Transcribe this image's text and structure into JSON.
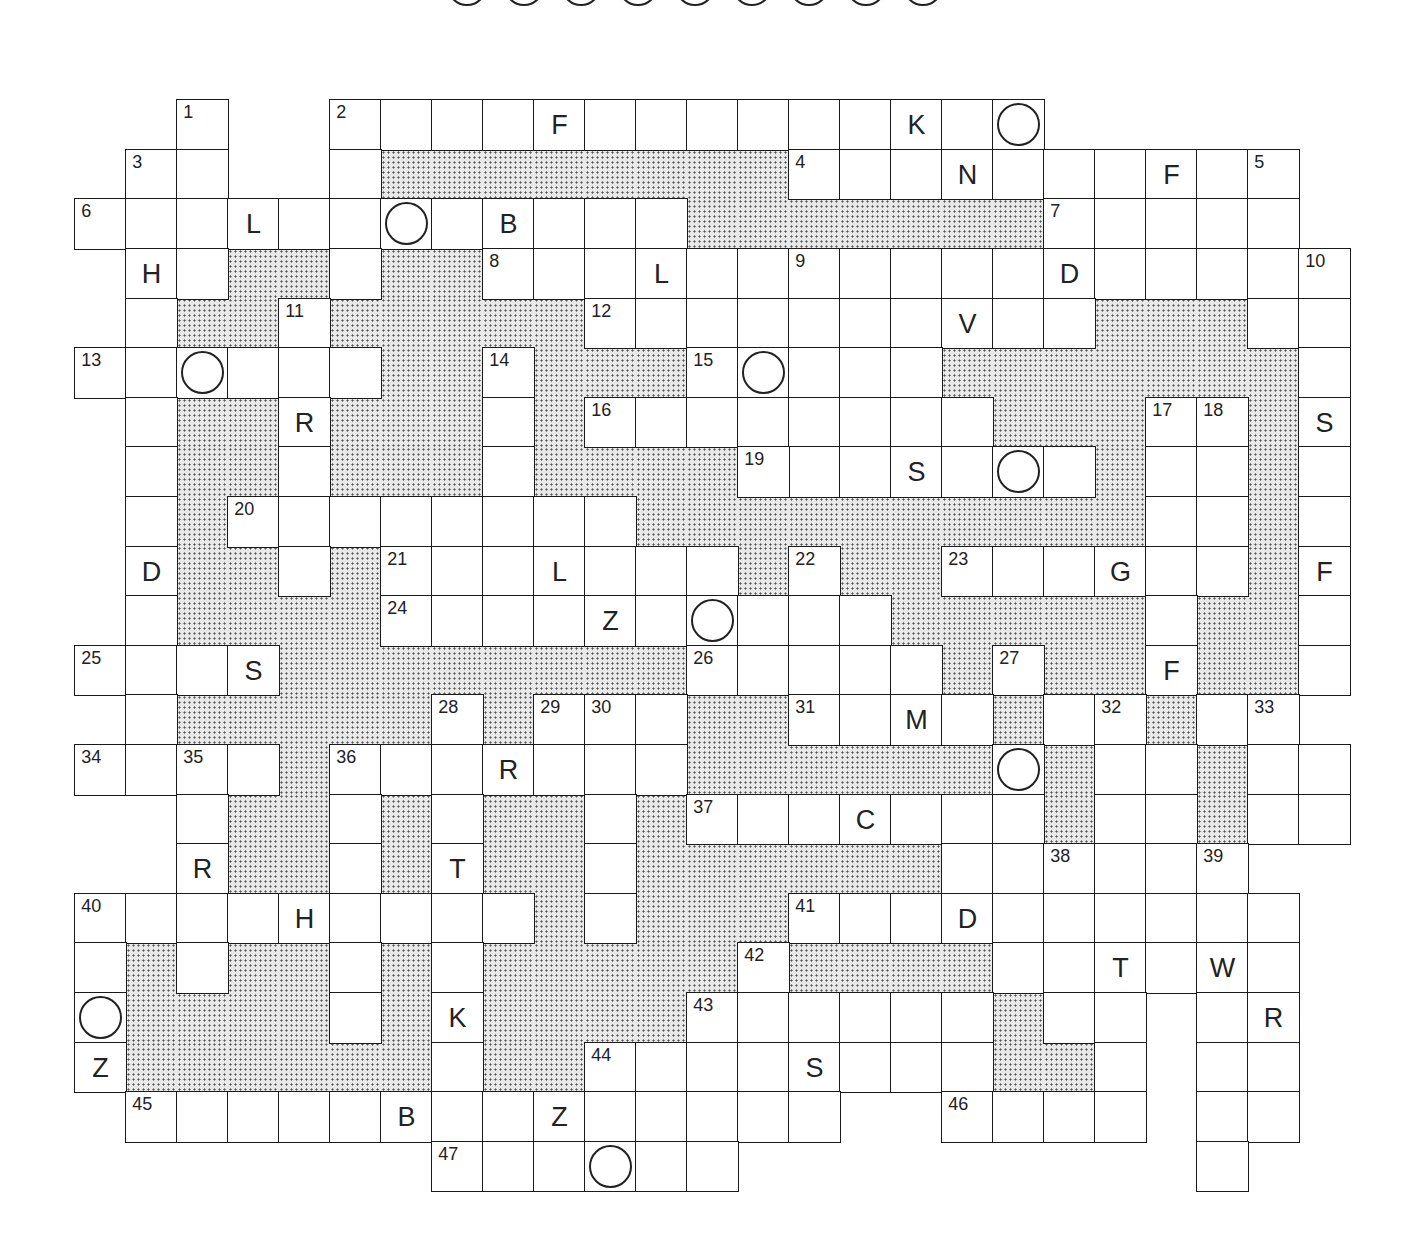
{
  "puzzle": {
    "answer_circle_count": 9,
    "cell_size": 51,
    "legend": {
      "empty": ".",
      "shaded": "#",
      "white": "W"
    },
    "rows": [
      "..W..WWWWWWWWWWWWWW.....",
      ".WW..W########WWWWWWWWWW",
      "WWWWWWWWWWWW#######WWWWW",
      ".WW##W##WWWWWWWWWWWWWWWWW",
      ".W##W#####WWWWWWWWWW###WW",
      "WWWWWW##W###WWWWW#######W",
      ".W##W###W#WWWWWWWW###WW#W",
      ".W##W###W#####WWWWWW#WW#W",
      ".W#WWWWWWWW##########WW#W",
      ".W##W#WWWWWWW#W##WWWWWW#W",
      ".W####WWWWWWWWWW#####W##W",
      "WWWW########WWWWW#W##W##W",
      ".W#####W#WWW##WWWW#WW#WW",
      "WWWW#WWWWWWW######W#WW#WW",
      "..W##W#W##W#WWWWWWW#WW#WW",
      "..W##W#W##W######WWWWWW",
      "WWWWWWWWW#W###WWWWWWWWWW",
      "W#W##W#W#####W####WWWWWW",
      "W####W#W####WWWWWW#WW.WW",
      "W######W##WWWWWWWW##W.WW",
      ".WWWWWWWWWWWWWW..WWWW.WW",
      ".......WWWWWW.........W."
    ],
    "numbers": [
      {
        "r": 0,
        "c": 2,
        "n": "1"
      },
      {
        "r": 0,
        "c": 5,
        "n": "2"
      },
      {
        "r": 1,
        "c": 1,
        "n": "3"
      },
      {
        "r": 1,
        "c": 14,
        "n": "4"
      },
      {
        "r": 1,
        "c": 23,
        "n": "5"
      },
      {
        "r": 2,
        "c": 0,
        "n": "6"
      },
      {
        "r": 2,
        "c": 19,
        "n": "7"
      },
      {
        "r": 3,
        "c": 8,
        "n": "8"
      },
      {
        "r": 3,
        "c": 14,
        "n": "9"
      },
      {
        "r": 3,
        "c": 24,
        "n": "10"
      },
      {
        "r": 4,
        "c": 4,
        "n": "11"
      },
      {
        "r": 4,
        "c": 10,
        "n": "12"
      },
      {
        "r": 5,
        "c": 0,
        "n": "13"
      },
      {
        "r": 5,
        "c": 8,
        "n": "14"
      },
      {
        "r": 5,
        "c": 12,
        "n": "15"
      },
      {
        "r": 6,
        "c": 10,
        "n": "16"
      },
      {
        "r": 6,
        "c": 21,
        "n": "17"
      },
      {
        "r": 6,
        "c": 22,
        "n": "18"
      },
      {
        "r": 7,
        "c": 13,
        "n": "19"
      },
      {
        "r": 8,
        "c": 3,
        "n": "20"
      },
      {
        "r": 9,
        "c": 6,
        "n": "21"
      },
      {
        "r": 9,
        "c": 14,
        "n": "22"
      },
      {
        "r": 9,
        "c": 17,
        "n": "23"
      },
      {
        "r": 10,
        "c": 6,
        "n": "24"
      },
      {
        "r": 11,
        "c": 0,
        "n": "25"
      },
      {
        "r": 11,
        "c": 12,
        "n": "26"
      },
      {
        "r": 11,
        "c": 18,
        "n": "27"
      },
      {
        "r": 12,
        "c": 7,
        "n": "28"
      },
      {
        "r": 12,
        "c": 9,
        "n": "29"
      },
      {
        "r": 12,
        "c": 10,
        "n": "30"
      },
      {
        "r": 12,
        "c": 14,
        "n": "31"
      },
      {
        "r": 12,
        "c": 20,
        "n": "32"
      },
      {
        "r": 12,
        "c": 23,
        "n": "33"
      },
      {
        "r": 13,
        "c": 0,
        "n": "34"
      },
      {
        "r": 13,
        "c": 2,
        "n": "35"
      },
      {
        "r": 13,
        "c": 5,
        "n": "36"
      },
      {
        "r": 14,
        "c": 12,
        "n": "37"
      },
      {
        "r": 15,
        "c": 19,
        "n": "38"
      },
      {
        "r": 15,
        "c": 22,
        "n": "39"
      },
      {
        "r": 16,
        "c": 0,
        "n": "40"
      },
      {
        "r": 16,
        "c": 14,
        "n": "41"
      },
      {
        "r": 17,
        "c": 13,
        "n": "42"
      },
      {
        "r": 18,
        "c": 12,
        "n": "43"
      },
      {
        "r": 19,
        "c": 10,
        "n": "44"
      },
      {
        "r": 20,
        "c": 1,
        "n": "45"
      },
      {
        "r": 20,
        "c": 17,
        "n": "46"
      },
      {
        "r": 21,
        "c": 7,
        "n": "47"
      }
    ],
    "letters": [
      {
        "r": 0,
        "c": 9,
        "ch": "F"
      },
      {
        "r": 0,
        "c": 16,
        "ch": "K"
      },
      {
        "r": 1,
        "c": 17,
        "ch": "N"
      },
      {
        "r": 1,
        "c": 21,
        "ch": "F"
      },
      {
        "r": 2,
        "c": 3,
        "ch": "L"
      },
      {
        "r": 2,
        "c": 8,
        "ch": "B"
      },
      {
        "r": 3,
        "c": 1,
        "ch": "H"
      },
      {
        "r": 3,
        "c": 11,
        "ch": "L"
      },
      {
        "r": 3,
        "c": 19,
        "ch": "D"
      },
      {
        "r": 4,
        "c": 17,
        "ch": "V"
      },
      {
        "r": 6,
        "c": 4,
        "ch": "R"
      },
      {
        "r": 6,
        "c": 24,
        "ch": "S"
      },
      {
        "r": 7,
        "c": 16,
        "ch": "S"
      },
      {
        "r": 9,
        "c": 1,
        "ch": "D"
      },
      {
        "r": 9,
        "c": 9,
        "ch": "L"
      },
      {
        "r": 9,
        "c": 20,
        "ch": "G"
      },
      {
        "r": 9,
        "c": 24,
        "ch": "F"
      },
      {
        "r": 10,
        "c": 10,
        "ch": "Z"
      },
      {
        "r": 11,
        "c": 3,
        "ch": "S"
      },
      {
        "r": 11,
        "c": 21,
        "ch": "F"
      },
      {
        "r": 12,
        "c": 16,
        "ch": "M"
      },
      {
        "r": 13,
        "c": 8,
        "ch": "R"
      },
      {
        "r": 14,
        "c": 15,
        "ch": "C"
      },
      {
        "r": 15,
        "c": 2,
        "ch": "R"
      },
      {
        "r": 15,
        "c": 7,
        "ch": "T"
      },
      {
        "r": 16,
        "c": 4,
        "ch": "H"
      },
      {
        "r": 16,
        "c": 17,
        "ch": "D"
      },
      {
        "r": 17,
        "c": 20,
        "ch": "T"
      },
      {
        "r": 17,
        "c": 22,
        "ch": "W"
      },
      {
        "r": 18,
        "c": 7,
        "ch": "K"
      },
      {
        "r": 18,
        "c": 23,
        "ch": "R"
      },
      {
        "r": 19,
        "c": 0,
        "ch": "Z"
      },
      {
        "r": 19,
        "c": 14,
        "ch": "S"
      },
      {
        "r": 20,
        "c": 6,
        "ch": "B"
      },
      {
        "r": 20,
        "c": 9,
        "ch": "Z"
      }
    ],
    "circles": [
      {
        "r": 0,
        "c": 18
      },
      {
        "r": 2,
        "c": 6
      },
      {
        "r": 5,
        "c": 2
      },
      {
        "r": 5,
        "c": 13
      },
      {
        "r": 7,
        "c": 18
      },
      {
        "r": 10,
        "c": 12
      },
      {
        "r": 13,
        "c": 18
      },
      {
        "r": 18,
        "c": 0
      },
      {
        "r": 21,
        "c": 10
      }
    ]
  }
}
